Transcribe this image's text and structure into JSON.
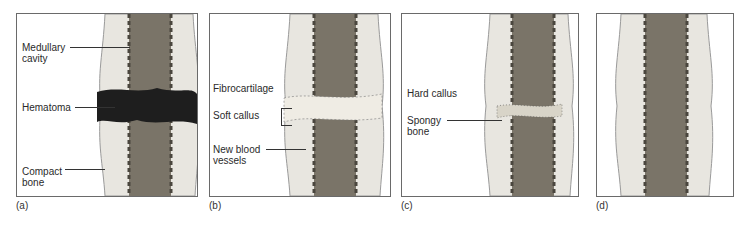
{
  "figure": {
    "panels": [
      {
        "id": "a",
        "caption": "(a)",
        "labels": {
          "medullary_cavity": "Medullary\ncavity",
          "hematoma": "Hematoma",
          "compact_bone": "Compact\nbone"
        }
      },
      {
        "id": "b",
        "caption": "(b)",
        "labels": {
          "fibrocartilage": "Fibrocartilage",
          "soft_callus": "Soft callus",
          "new_blood_vessels": "New blood\nvessels"
        }
      },
      {
        "id": "c",
        "caption": "(c)",
        "labels": {
          "hard_callus": "Hard callus",
          "spongy_bone": "Spongy\nbone"
        }
      },
      {
        "id": "d",
        "caption": "(d)",
        "labels": {}
      }
    ]
  },
  "colors": {
    "marrow": "#7a7468",
    "marrow_dark": "#4a463e",
    "compact": "#e8e6e0",
    "outline": "#8a8a8a",
    "hematoma": "#1e1e1e",
    "callus": "#efece4"
  }
}
